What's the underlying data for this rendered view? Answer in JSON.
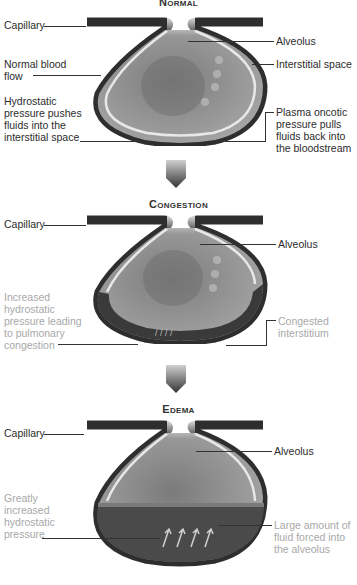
{
  "panels": [
    {
      "title": "Normal",
      "labels_left": [
        {
          "text": "Capillary"
        },
        {
          "text": "Normal blood flow"
        },
        {
          "text": "Hydrostatic pressure pushes fluids into the interstitial space"
        }
      ],
      "labels_right": [
        {
          "text": "Alveolus"
        },
        {
          "text": "Interstitial space"
        },
        {
          "text": "Plasma oncotic pressure pulls fluids back into the bloodstream"
        }
      ]
    },
    {
      "title": "Congestion",
      "labels_left": [
        {
          "text": "Capillary"
        },
        {
          "text": "Increased hydrostatic pressure leading to pulmonary congestion"
        }
      ],
      "labels_right": [
        {
          "text": "Alveolus"
        },
        {
          "text": "Congested interstitium"
        }
      ]
    },
    {
      "title": "Edema",
      "labels_left": [
        {
          "text": "Capillary"
        },
        {
          "text": "Greatly increased hydrostatic pressure"
        }
      ],
      "labels_right": [
        {
          "text": "Alveolus"
        },
        {
          "text": "Large amount of fluid forced into the alveolus"
        }
      ]
    }
  ],
  "arrows": [
    {
      "icon": "down-arrow-icon"
    },
    {
      "icon": "down-arrow-icon"
    }
  ],
  "colors": {
    "wall_dark": "#2e2e2e",
    "alveolus_gray": "#8c8c8c",
    "membrane": "#e8e8e8",
    "fluid": "#4a4a4a",
    "gray_text": "#a8a8a8"
  }
}
